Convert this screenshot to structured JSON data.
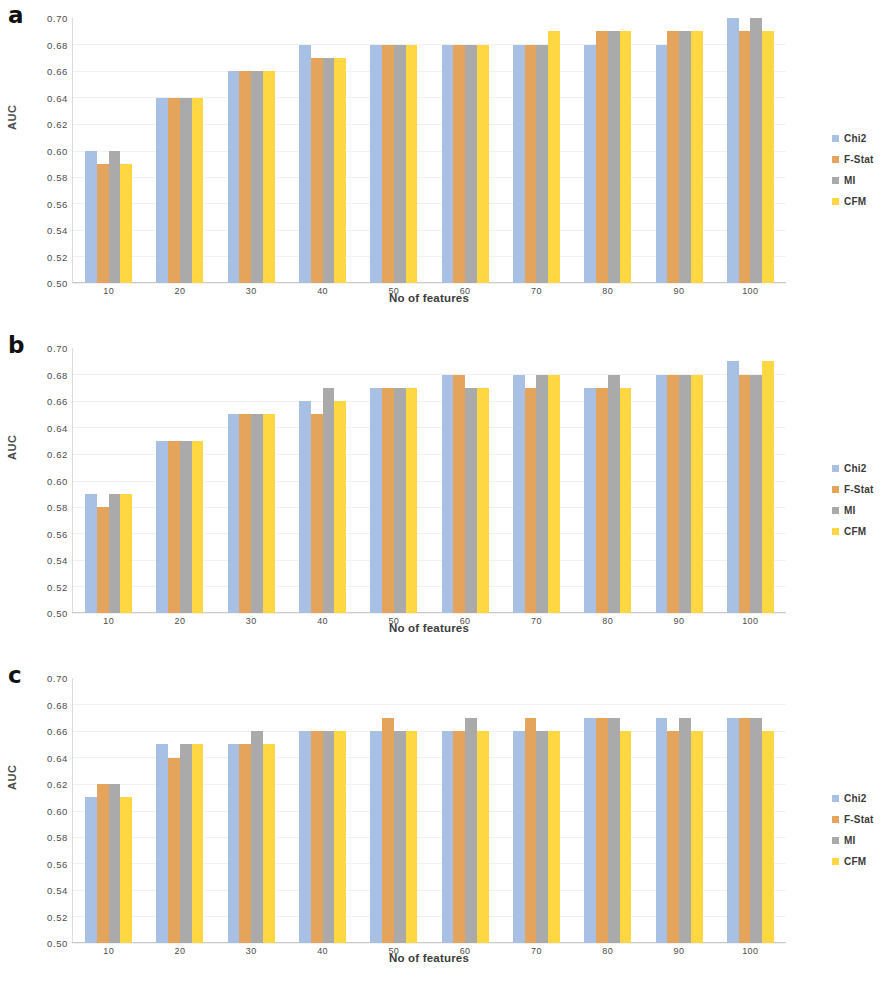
{
  "figure": {
    "panels": [
      {
        "letter": "a",
        "ylabel": "AUC",
        "xlabel": "No of features"
      },
      {
        "letter": "b",
        "ylabel": "AUC",
        "xlabel": "No of features"
      },
      {
        "letter": "c",
        "ylabel": "AUC",
        "xlabel": "No of features"
      }
    ],
    "legend": [
      {
        "label": "Chi2",
        "color": "#a7c0e4"
      },
      {
        "label": "F-Stat",
        "color": "#e3a champion"
      },
      {
        "label": "MI",
        "color": "#aaaaaa"
      },
      {
        "label": "CFM",
        "color": "#ffd742"
      }
    ],
    "y_tick_labels": [
      "0.70",
      "0.68",
      "0.66",
      "0.64",
      "0.62",
      "0.60",
      "0.58",
      "0.56",
      "0.54",
      "0.52",
      "0.50"
    ],
    "x_tick_labels": [
      "10",
      "20",
      "30",
      "40",
      "50",
      "60",
      "70",
      "80",
      "90",
      "100"
    ]
  },
  "chart_data": [
    {
      "type": "bar",
      "panel": "a",
      "title": "",
      "xlabel": "No of features",
      "ylabel": "AUC",
      "ylim": [
        0.5,
        0.7
      ],
      "ytick_step": 0.02,
      "grid": true,
      "legend_position": "right",
      "categories": [
        "10",
        "20",
        "30",
        "40",
        "50",
        "60",
        "70",
        "80",
        "90",
        "100"
      ],
      "series": [
        {
          "name": "Chi2",
          "color": "#a7c0e4",
          "values": [
            0.6,
            0.64,
            0.66,
            0.68,
            0.68,
            0.68,
            0.68,
            0.68,
            0.68,
            0.7
          ]
        },
        {
          "name": "F-Stat",
          "color": "#e5a45c",
          "values": [
            0.59,
            0.64,
            0.66,
            0.67,
            0.68,
            0.68,
            0.68,
            0.69,
            0.69,
            0.69
          ]
        },
        {
          "name": "MI",
          "color": "#aaaaaa",
          "values": [
            0.6,
            0.64,
            0.66,
            0.67,
            0.68,
            0.68,
            0.68,
            0.69,
            0.69,
            0.7
          ]
        },
        {
          "name": "CFM",
          "color": "#ffd742",
          "values": [
            0.59,
            0.64,
            0.66,
            0.67,
            0.68,
            0.68,
            0.69,
            0.69,
            0.69,
            0.69
          ]
        }
      ]
    },
    {
      "type": "bar",
      "panel": "b",
      "title": "",
      "xlabel": "No of features",
      "ylabel": "AUC",
      "ylim": [
        0.5,
        0.7
      ],
      "ytick_step": 0.02,
      "grid": true,
      "legend_position": "right",
      "categories": [
        "10",
        "20",
        "30",
        "40",
        "50",
        "60",
        "70",
        "80",
        "90",
        "100"
      ],
      "series": [
        {
          "name": "Chi2",
          "color": "#a7c0e4",
          "values": [
            0.59,
            0.63,
            0.65,
            0.66,
            0.67,
            0.68,
            0.68,
            0.67,
            0.68,
            0.69
          ]
        },
        {
          "name": "F-Stat",
          "color": "#e5a45c",
          "values": [
            0.58,
            0.63,
            0.65,
            0.65,
            0.67,
            0.68,
            0.67,
            0.67,
            0.68,
            0.68
          ]
        },
        {
          "name": "MI",
          "color": "#aaaaaa",
          "values": [
            0.59,
            0.63,
            0.65,
            0.67,
            0.67,
            0.67,
            0.68,
            0.68,
            0.68,
            0.68
          ]
        },
        {
          "name": "CFM",
          "color": "#ffd742",
          "values": [
            0.59,
            0.63,
            0.65,
            0.66,
            0.67,
            0.67,
            0.68,
            0.67,
            0.68,
            0.69
          ]
        }
      ]
    },
    {
      "type": "bar",
      "panel": "c",
      "title": "",
      "xlabel": "No of features",
      "ylabel": "AUC",
      "ylim": [
        0.5,
        0.7
      ],
      "ytick_step": 0.02,
      "grid": true,
      "legend_position": "right",
      "categories": [
        "10",
        "20",
        "30",
        "40",
        "50",
        "60",
        "70",
        "80",
        "90",
        "100"
      ],
      "series": [
        {
          "name": "Chi2",
          "color": "#a7c0e4",
          "values": [
            0.61,
            0.65,
            0.65,
            0.66,
            0.66,
            0.66,
            0.66,
            0.67,
            0.67,
            0.67
          ]
        },
        {
          "name": "F-Stat",
          "color": "#e5a45c",
          "values": [
            0.62,
            0.64,
            0.65,
            0.66,
            0.67,
            0.66,
            0.67,
            0.67,
            0.66,
            0.67
          ]
        },
        {
          "name": "MI",
          "color": "#aaaaaa",
          "values": [
            0.62,
            0.65,
            0.66,
            0.66,
            0.66,
            0.67,
            0.66,
            0.67,
            0.67,
            0.67
          ]
        },
        {
          "name": "CFM",
          "color": "#ffd742",
          "values": [
            0.61,
            0.65,
            0.65,
            0.66,
            0.66,
            0.66,
            0.66,
            0.66,
            0.66,
            0.66
          ]
        }
      ]
    }
  ]
}
